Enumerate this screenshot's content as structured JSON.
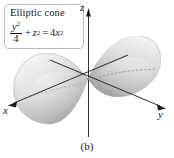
{
  "figure": {
    "caption": "(b)",
    "label": {
      "title": "Elliptic cone",
      "equation": {
        "plain": "y^2/4 + z^2 = 4x^2",
        "numerator_var": "y",
        "numerator_exp": "2",
        "denominator": "4",
        "plus": "+",
        "second_var": "z",
        "second_exp": "2",
        "equals": "=",
        "rhs_coefficient": "4",
        "rhs_var": "x",
        "rhs_exp": "2"
      }
    },
    "axes": {
      "x_label": "x",
      "y_label": "y",
      "z_label": "z"
    },
    "colors": {
      "surface_light": "#f4f4f4",
      "surface_mid": "#cfcfcf",
      "surface_dark": "#9a9a9a",
      "axis": "#1b1b1b",
      "box_border": "#b9b9b9",
      "text": "#17171a",
      "background": "#ffffff"
    },
    "surface": {
      "name": "elliptic-cone",
      "nappes": 2,
      "apex": "origin",
      "axis_of_symmetry": "x"
    }
  }
}
